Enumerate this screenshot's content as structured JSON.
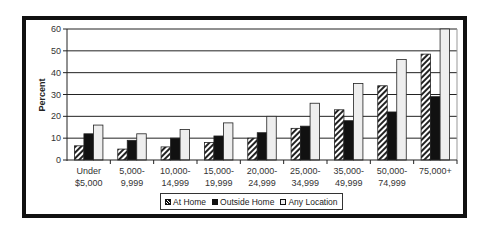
{
  "chart_data": {
    "type": "bar",
    "title": "",
    "xlabel": "",
    "ylabel": "Percent",
    "ylim": [
      0,
      60
    ],
    "yticks": [
      0,
      10,
      20,
      30,
      40,
      50,
      60
    ],
    "grid": true,
    "legend_position": "bottom",
    "categories": [
      "Under $5,000",
      "5,000-9,999",
      "10,000-14,999",
      "15,000-19,999",
      "20,000-24,999",
      "25,000-34,999",
      "35,000-49,999",
      "50,000-74,999",
      "75,000+"
    ],
    "category_lines": [
      [
        "Under",
        "$5,000"
      ],
      [
        "5,000-",
        "9,999"
      ],
      [
        "10,000-",
        "14,999"
      ],
      [
        "15,000-",
        "19,999"
      ],
      [
        "20,000-",
        "24,999"
      ],
      [
        "25,000-",
        "34,999"
      ],
      [
        "35,000-",
        "49,999"
      ],
      [
        "50,000-",
        "74,999"
      ],
      [
        "75,000+",
        ""
      ]
    ],
    "series": [
      {
        "name": "At Home",
        "pattern": "hatch",
        "color": "#111111",
        "values": [
          6.5,
          5,
          6,
          8,
          10,
          14.5,
          23,
          34,
          48.5
        ]
      },
      {
        "name": "Outside Home",
        "pattern": "solid",
        "color": "#111111",
        "values": [
          12,
          9,
          10,
          11,
          12.5,
          15.5,
          18,
          22,
          29
        ]
      },
      {
        "name": "Any Location",
        "pattern": "solid",
        "color": "#eeeeee",
        "values": [
          16,
          12,
          14,
          17,
          20,
          26,
          35,
          46,
          60
        ]
      }
    ]
  },
  "legend": {
    "items": [
      "At Home",
      "Outside Home",
      "Any Location"
    ]
  }
}
